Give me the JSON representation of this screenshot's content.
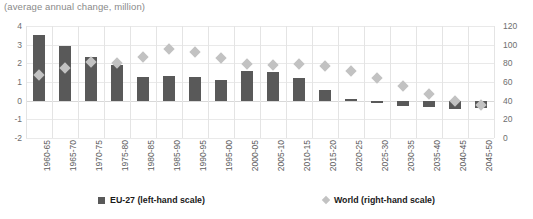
{
  "chart_data": {
    "type": "bar",
    "title": "(average annual change, million)",
    "xlabel": "",
    "ylabel": "",
    "grid": true,
    "legend_position": "bottom",
    "categories": [
      "1960-65",
      "1965-70",
      "1970-75",
      "1975-80",
      "1980-85",
      "1985-90",
      "1990-95",
      "1995-00",
      "2000-05",
      "2005-10",
      "2010-15",
      "2015-20",
      "2020-25",
      "2025-30",
      "2030-35",
      "2035-40",
      "2040-45",
      "2045-50"
    ],
    "series": [
      {
        "name": "EU-27 (left-hand scale)",
        "type": "bar",
        "axis": "left",
        "color": "#595959",
        "values": [
          3.5,
          2.95,
          2.35,
          1.9,
          1.25,
          1.3,
          1.25,
          1.1,
          1.6,
          1.55,
          1.2,
          0.55,
          0.1,
          -0.1,
          -0.3,
          -0.35,
          -0.45,
          -0.4
        ]
      },
      {
        "name": "World (right-hand scale)",
        "type": "scatter",
        "axis": "right",
        "color": "#c2c2c2",
        "marker": "diamond",
        "values": [
          68,
          75,
          82,
          80,
          87,
          95,
          92,
          86,
          79,
          78,
          79,
          77,
          72,
          64,
          56,
          47,
          40,
          35
        ]
      }
    ],
    "left_axis": {
      "label": "",
      "ticks": [
        "4",
        "3",
        "2",
        "1",
        "0",
        "-1",
        "-2"
      ],
      "ylim": [
        -2,
        4
      ]
    },
    "right_axis": {
      "label": "",
      "ticks": [
        "120",
        "100",
        "80",
        "60",
        "40",
        "20",
        "0"
      ],
      "ylim": [
        0,
        120
      ]
    }
  },
  "legend": {
    "items": [
      {
        "label": "EU-27 (left-hand scale)",
        "marker": "square-marker",
        "color": "#595959"
      },
      {
        "label": "World (right-hand scale)",
        "marker": "diamond-marker",
        "color": "#c2c2c2"
      }
    ]
  }
}
